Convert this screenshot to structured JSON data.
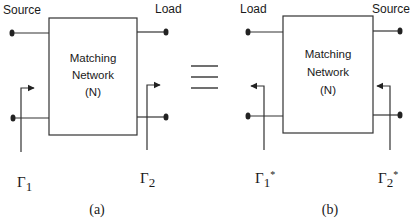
{
  "figure": {
    "equivalence_symbol": "≡",
    "panel_a": {
      "caption": "(a)",
      "left_terminal_label": "Source",
      "right_terminal_label": "Load",
      "box": {
        "line1": "Matching",
        "line2": "Network",
        "line3": "(N)"
      },
      "left_reflection": {
        "symbol": "Γ",
        "subscript": "1",
        "suffix": ""
      },
      "right_reflection": {
        "symbol": "Γ",
        "subscript": "2",
        "suffix": ""
      },
      "arrow_direction": "right"
    },
    "panel_b": {
      "caption": "(b)",
      "left_terminal_label": "Load",
      "right_terminal_label": "Source",
      "box": {
        "line1": "Matching",
        "line2": "Network",
        "line3": "(N)"
      },
      "left_reflection": {
        "symbol": "Γ",
        "subscript": "1",
        "suffix": "*"
      },
      "right_reflection": {
        "symbol": "Γ",
        "subscript": "2",
        "suffix": "*"
      },
      "arrow_direction": "left"
    }
  }
}
